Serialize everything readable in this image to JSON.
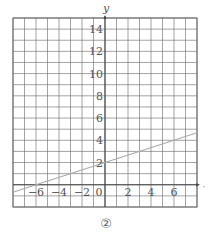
{
  "chart_data": {
    "type": "line",
    "title": "",
    "caption": "②",
    "xlabel": "",
    "ylabel": "y",
    "xlim": [
      -8,
      8
    ],
    "ylim": [
      -2,
      15
    ],
    "grid": true,
    "grid_step": 1,
    "x_ticks": [
      -6,
      -4,
      -2,
      0,
      2,
      4,
      6
    ],
    "x_tick_labels": [
      "−6",
      "−4",
      "−2",
      "0",
      "2",
      "4",
      "6"
    ],
    "y_ticks": [
      2,
      4,
      6,
      8,
      10,
      12,
      14
    ],
    "y_tick_labels": [
      "2",
      "4",
      "6",
      "8",
      "10",
      "12",
      "14"
    ],
    "series": [
      {
        "name": "line",
        "equation": "y = x/3 + 2",
        "x": [
          -8,
          -6,
          0,
          8
        ],
        "y": [
          -0.67,
          0,
          2,
          4.67
        ],
        "color": "#aaaaaa"
      }
    ],
    "legend": null
  },
  "colors": {
    "grid": "#666666",
    "axis": "#444444",
    "line": "#aaaaaa",
    "text": "#555555"
  }
}
